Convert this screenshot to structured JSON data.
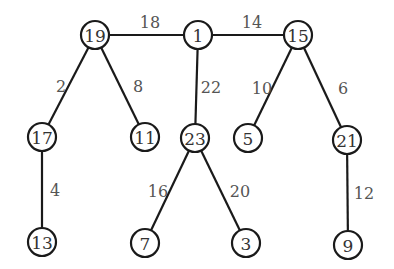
{
  "graph": {
    "type": "weighted-tree",
    "node_radius": 14,
    "nodes": [
      {
        "id": "19",
        "label": "19",
        "x": 95,
        "y": 35
      },
      {
        "id": "1",
        "label": "1",
        "x": 198,
        "y": 35
      },
      {
        "id": "15",
        "label": "15",
        "x": 298,
        "y": 35
      },
      {
        "id": "17",
        "label": "17",
        "x": 42,
        "y": 137
      },
      {
        "id": "11",
        "label": "11",
        "x": 145,
        "y": 137
      },
      {
        "id": "23",
        "label": "23",
        "x": 195,
        "y": 138
      },
      {
        "id": "5",
        "label": "5",
        "x": 248,
        "y": 138
      },
      {
        "id": "21",
        "label": "21",
        "x": 347,
        "y": 140
      },
      {
        "id": "13",
        "label": "13",
        "x": 42,
        "y": 242
      },
      {
        "id": "7",
        "label": "7",
        "x": 145,
        "y": 243
      },
      {
        "id": "3",
        "label": "3",
        "x": 246,
        "y": 243
      },
      {
        "id": "9",
        "label": "9",
        "x": 348,
        "y": 245
      }
    ],
    "edges": [
      {
        "from": "19",
        "to": "1",
        "weight": "18",
        "lx": 150,
        "ly": 22
      },
      {
        "from": "1",
        "to": "15",
        "weight": "14",
        "lx": 252,
        "ly": 22
      },
      {
        "from": "19",
        "to": "17",
        "weight": "2",
        "lx": 61,
        "ly": 86
      },
      {
        "from": "19",
        "to": "11",
        "weight": "8",
        "lx": 138,
        "ly": 86
      },
      {
        "from": "1",
        "to": "23",
        "weight": "22",
        "lx": 211,
        "ly": 87
      },
      {
        "from": "15",
        "to": "5",
        "weight": "10",
        "lx": 262,
        "ly": 88
      },
      {
        "from": "15",
        "to": "21",
        "weight": "6",
        "lx": 343,
        "ly": 88
      },
      {
        "from": "17",
        "to": "13",
        "weight": "4",
        "lx": 55,
        "ly": 190
      },
      {
        "from": "23",
        "to": "7",
        "weight": "16",
        "lx": 158,
        "ly": 191
      },
      {
        "from": "23",
        "to": "3",
        "weight": "20",
        "lx": 240,
        "ly": 191
      },
      {
        "from": "21",
        "to": "9",
        "weight": "12",
        "lx": 364,
        "ly": 193
      }
    ]
  }
}
